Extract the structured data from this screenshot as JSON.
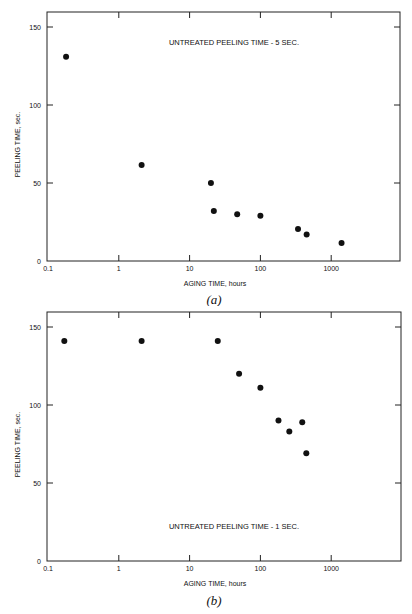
{
  "chart_data": [
    {
      "type": "scatter",
      "panel": "(a)",
      "title": "",
      "annotation": "UNTREATED PEELING TIME - 5 SEC.",
      "xlabel": "AGING TIME, hours",
      "ylabel": "PEELING TIME, sec.",
      "xscale": "log",
      "xlim": [
        0.1,
        10000
      ],
      "ylim": [
        0,
        160
      ],
      "xticks": [
        "0.1",
        "1",
        "10",
        "100",
        "1000"
      ],
      "yticks": [
        "0",
        "50",
        "100",
        "150"
      ],
      "grid": false,
      "legend": null,
      "points": [
        {
          "x": 0.18,
          "y": 131
        },
        {
          "x": 2.1,
          "y": 61.5
        },
        {
          "x": 20,
          "y": 50
        },
        {
          "x": 22,
          "y": 32
        },
        {
          "x": 47,
          "y": 30
        },
        {
          "x": 100,
          "y": 29
        },
        {
          "x": 340,
          "y": 20.5
        },
        {
          "x": 450,
          "y": 17
        },
        {
          "x": 1400,
          "y": 11.5
        }
      ]
    },
    {
      "type": "scatter",
      "panel": "(b)",
      "title": "",
      "annotation": "UNTREATED PEELING TIME - 1 SEC.",
      "xlabel": "AGING TIME, hours",
      "ylabel": "PEELING TIME, sec.",
      "xscale": "log",
      "xlim": [
        0.1,
        10000
      ],
      "ylim": [
        0,
        160
      ],
      "xticks": [
        "0.1",
        "1",
        "10",
        "100",
        "1000"
      ],
      "yticks": [
        "0",
        "50",
        "100",
        "150"
      ],
      "grid": false,
      "legend": null,
      "points": [
        {
          "x": 0.17,
          "y": 141
        },
        {
          "x": 2.1,
          "y": 141
        },
        {
          "x": 25,
          "y": 141
        },
        {
          "x": 50,
          "y": 120
        },
        {
          "x": 100,
          "y": 111
        },
        {
          "x": 180,
          "y": 90
        },
        {
          "x": 256,
          "y": 83
        },
        {
          "x": 390,
          "y": 89
        },
        {
          "x": 445,
          "y": 69
        }
      ]
    }
  ]
}
